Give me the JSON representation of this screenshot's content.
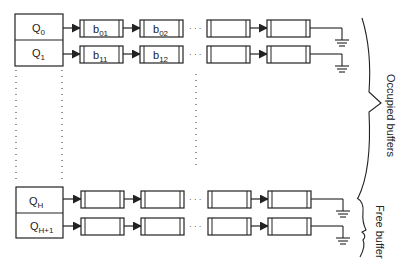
{
  "diagram": {
    "queues": [
      {
        "id": "q0",
        "label": "Q",
        "sub": "0",
        "y": 14,
        "buffers": [
          "b01_label",
          "b02_label"
        ]
      },
      {
        "id": "q1",
        "label": "Q",
        "sub": "1",
        "y": 40
      },
      {
        "id": "qh",
        "label": "Q",
        "sub": "H",
        "y": 187
      },
      {
        "id": "qh1",
        "label": "Q",
        "sub": "H+1",
        "y": 213
      }
    ],
    "buffer_labels": {
      "b01": {
        "main": "b",
        "sub": "01"
      },
      "b02": {
        "main": "b",
        "sub": "02"
      },
      "b11": {
        "main": "b",
        "sub": "11"
      },
      "b12": {
        "main": "b",
        "sub": "12"
      }
    },
    "ellipsis": "· · ·",
    "braces": {
      "occupied": "Occupied buffers",
      "free": "Free buffer"
    },
    "stroke_color": "#222222",
    "background": "#ffffff"
  }
}
